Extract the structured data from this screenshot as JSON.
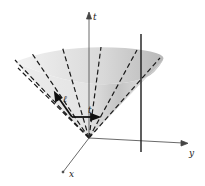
{
  "diagram": {
    "type": "light-cone",
    "axes": {
      "t": {
        "label": "t"
      },
      "x": {
        "label": "x"
      },
      "y": {
        "label": "y"
      }
    },
    "vectors": {
      "ell": {
        "label": "ℓ"
      },
      "t_vec": {
        "label": "t"
      }
    },
    "colors": {
      "cone_fill_light": "#e6e6e6",
      "cone_fill_dark": "#bdbdbd",
      "line": "#1a1a1a",
      "axis": "#444444"
    }
  }
}
